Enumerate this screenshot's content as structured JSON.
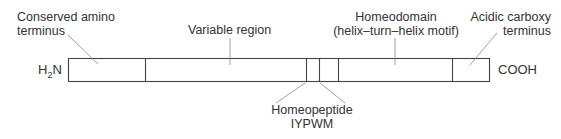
{
  "diagram": {
    "type": "protein-domain-map",
    "n_terminus_label": "H",
    "n_terminus_sub": "2",
    "n_terminus_suffix": "N",
    "c_terminus_label": "COOH",
    "labels": {
      "conserved_line1": "Conserved amino",
      "conserved_line2": "terminus",
      "variable": "Variable region",
      "homeodomain_line1": "Homeodomain",
      "homeodomain_line2": "(helix–turn–helix motif)",
      "acidic_line1": "Acidic carboxy",
      "acidic_line2": "terminus",
      "homeopeptide_line1": "Homeopeptide",
      "homeopeptide_line2": "IYPWM"
    },
    "segments": [
      {
        "name": "Conserved amino terminus",
        "x_start": 68,
        "x_end": 145
      },
      {
        "name": "Variable region",
        "x_start": 145,
        "x_end": 306
      },
      {
        "name": "Homeopeptide IYPWM",
        "x_start": 306,
        "x_end": 319
      },
      {
        "name": "Linker",
        "x_start": 319,
        "x_end": 338
      },
      {
        "name": "Homeodomain",
        "x_start": 338,
        "x_end": 452
      },
      {
        "name": "Acidic carboxy terminus",
        "x_start": 452,
        "x_end": 490
      }
    ],
    "colors": {
      "line": "#333333",
      "leader": "#777777",
      "text": "#333333"
    }
  }
}
